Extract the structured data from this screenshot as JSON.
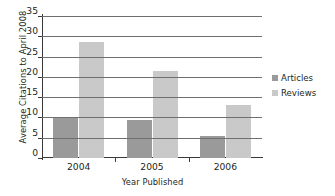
{
  "chart_data": {
    "type": "bar",
    "title": "",
    "xlabel": "Year Published",
    "ylabel": "Average Citations to April 2008",
    "categories": [
      "2004",
      "2005",
      "2006"
    ],
    "series": [
      {
        "name": "Articles",
        "color": "#9a9a9a",
        "values": [
          10.1,
          9.3,
          5.5
        ]
      },
      {
        "name": "Reviews",
        "color": "#c9c9c9",
        "values": [
          28.5,
          21.5,
          13.0
        ]
      }
    ],
    "ylim": [
      0,
      35
    ],
    "yticks": [
      0,
      5,
      10,
      15,
      20,
      25,
      30,
      35
    ],
    "ytick_labels": [
      "0",
      "5",
      "10",
      "15",
      "20",
      "25",
      "30",
      "35"
    ],
    "grid": true,
    "grid_axis": "y",
    "legend_position": "right",
    "legend_entries": [
      "Articles",
      "Reviews"
    ]
  }
}
